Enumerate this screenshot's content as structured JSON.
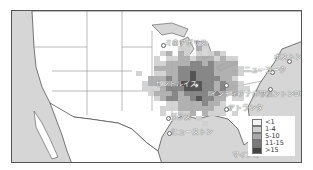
{
  "map": {
    "region": "United States (contiguous) and northern Mexico",
    "colors": {
      "water": "#d6d6d6",
      "land": "#ffffff",
      "border": "#555555"
    },
    "cities": [
      {
        "name": "ミネアポリス",
        "id": "minneapolis"
      },
      {
        "name": "セントルイス",
        "id": "st-louis"
      },
      {
        "name": "インディアナポリス",
        "id": "indianapolis"
      },
      {
        "name": "ニューヨーク",
        "id": "new-york"
      },
      {
        "name": "ボストン",
        "id": "boston"
      },
      {
        "name": "ワシントンDC",
        "id": "washington-dc"
      },
      {
        "name": "アトランタ",
        "id": "atlanta"
      },
      {
        "name": "ダラス",
        "id": "dallas"
      },
      {
        "name": "ヒューストン",
        "id": "houston"
      },
      {
        "name": "マイアミ",
        "id": "miami"
      }
    ],
    "legend": {
      "items": [
        {
          "label": "<1",
          "color": "#f4f4f4"
        },
        {
          "label": "1-4",
          "color": "#cfcfcf"
        },
        {
          "label": "5-10",
          "color": "#a8a8a8"
        },
        {
          "label": "11-15",
          "color": "#7a7a7a"
        },
        {
          "label": ">15",
          "color": "#444444"
        }
      ]
    }
  }
}
